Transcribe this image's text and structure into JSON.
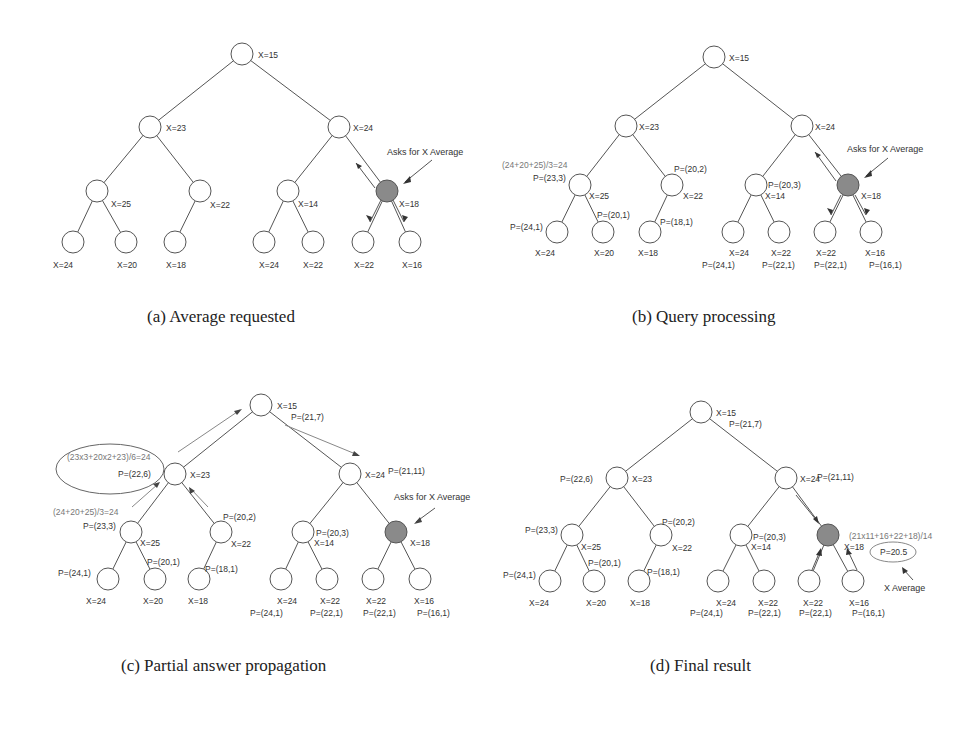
{
  "figure": {
    "panels": [
      {
        "id": "a",
        "caption": "(a) Average requested",
        "annotation": "Asks for X Average"
      },
      {
        "id": "b",
        "caption": "(b) Query processing",
        "annotation": "Asks for X Average",
        "formula": "(24+20+25)/3=24"
      },
      {
        "id": "c",
        "caption": "(c) Partial answer propagation",
        "annotation": "Asks for X Average",
        "formula_left": "(24+20+25)/3=24",
        "formula_ellipse": "(23x3+20x2+23)/6=24"
      },
      {
        "id": "d",
        "caption": "(d) Final result",
        "formula": "(21x11+16+22+18)/14",
        "result": "P=20.5",
        "result_label": "X Average"
      }
    ],
    "node_labels": {
      "root": "X=15",
      "l1_left": "X=23",
      "l1_right": "X=24",
      "l2_1": "X=25",
      "l2_2": "X=22",
      "l2_3": "X=14",
      "l2_4": "X=18",
      "leaf_1": "X=24",
      "leaf_2": "X=20",
      "leaf_3": "X=18",
      "leaf_4": "X=24",
      "leaf_5": "X=22",
      "leaf_6": "X=22",
      "leaf_7": "X=16"
    },
    "partials": {
      "root": "P=(21,7)",
      "l1_left": "P=(22,6)",
      "l1_right": "P=(21,11)",
      "l2_1": "P=(23,3)",
      "l2_2": "P=(20,2)",
      "l2_3": "P=(20,3)",
      "leaf_1": "P=(24,1)",
      "leaf_2": "P=(20,1)",
      "leaf_3": "P=(18,1)",
      "leaf_4": "P=(24,1)",
      "leaf_5": "P=(22,1)",
      "leaf_6": "P=(22,1)",
      "leaf_7": "P=(16,1)"
    },
    "colors": {
      "node_fill": "#ffffff",
      "node_stroke": "#555555",
      "querying_node_fill": "#8a8a8a",
      "edge": "#555555"
    }
  }
}
